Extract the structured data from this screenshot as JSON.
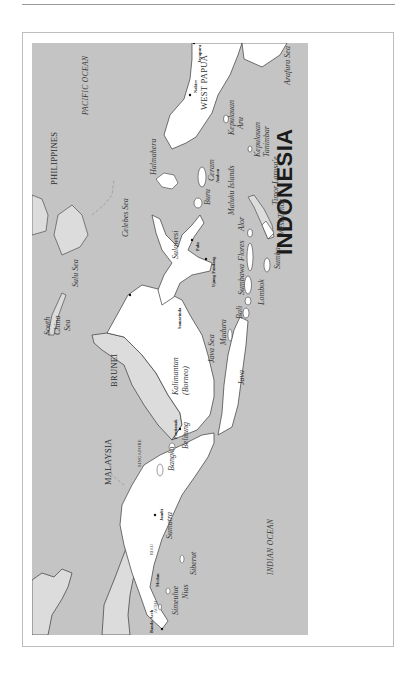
{
  "page": {
    "header_left": "",
    "header_right": ""
  },
  "map": {
    "title": "INDONESIA",
    "colors": {
      "sea": "#c4c4c4",
      "indonesia_land": "#ffffff",
      "other_land": "#dcdcdc",
      "coastline": "#3a3a3a",
      "border_dashed": "#8a8a8a"
    },
    "countries": {
      "malaysia": "MALAYSIA",
      "brunei": "BRUNEI",
      "philippines": "PHILIPPINES",
      "singapore": "SINGAPORE",
      "west_papua": "WEST PAPUA"
    },
    "seas": {
      "pacific": "PACIFIC OCEAN",
      "indian": "INDIAN OCEAN",
      "south_china_1": "South",
      "south_china_2": "China",
      "south_china_3": "Sea",
      "sulu": "Sulu Sea",
      "celebes": "Celebes Sea",
      "java": "Java Sea",
      "arafura": "Arafura Sea"
    },
    "islands": {
      "sumatra": "Sumatra",
      "simeulue": "Simeulue",
      "nias": "Nias",
      "siberut": "Siberut",
      "bangka": "Bangka",
      "belitung": "Belitung",
      "kalimantan": "Kalimantan",
      "borneo": "(Borneo)",
      "java": "Java",
      "madura": "Madura",
      "bali": "Bali",
      "lombok": "Lombok",
      "sumbawa": "Sumbawa",
      "sumba": "Sumba",
      "flores": "Flores",
      "alor": "Alor",
      "sulawesi": "Sulawesi",
      "halmahera": "Halmahera",
      "buru": "Buru",
      "ceram": "Ceram",
      "maluku": "Maluku Islands",
      "timor_larosae": "Timor Larosa'e",
      "west_timor": "West Timor",
      "kep_aru_1": "Kepulauan",
      "kep_aru_2": "Aru",
      "kep_tan_1": "Kepulauan",
      "kep_tan_2": "Tanimbar"
    },
    "cities": {
      "banda_aceh": "Banda Aceh",
      "medan": "Medan",
      "jambi": "Jambi",
      "pontianak": "Pontianak",
      "samarinda": "Samarinda",
      "ujung_pandang": "Ujung Pandang",
      "palu": "Palu",
      "ambon": "Ambon",
      "nabire": "Nabire",
      "jayapura": "Jayapura"
    },
    "regions": {
      "aceh": "ACEH",
      "riau": "RIAU"
    }
  }
}
